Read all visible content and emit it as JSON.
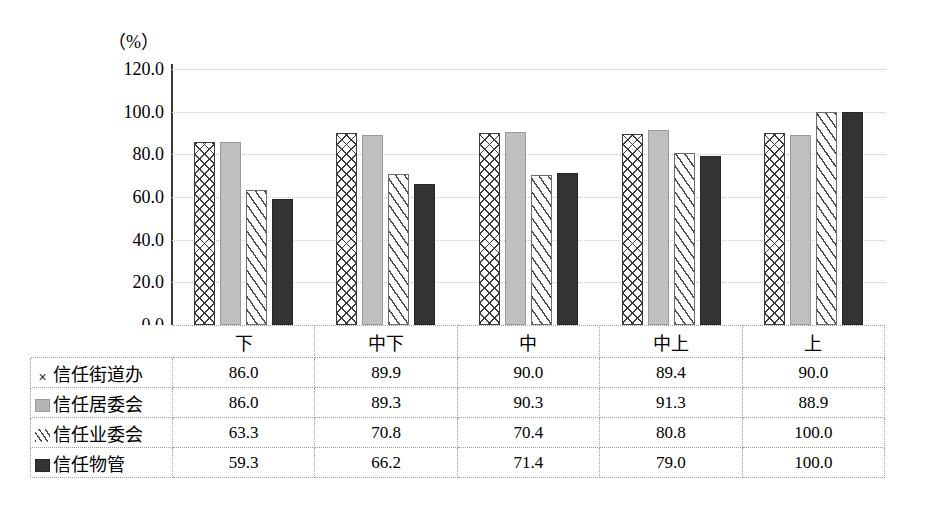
{
  "chart_data": {
    "type": "bar",
    "title": "",
    "subtitle": "",
    "xlabel": "",
    "ylabel": "(%)",
    "unit_label": "（%）",
    "ylim": [
      0.0,
      120.0
    ],
    "ytick_step": 20.0,
    "ytick_labels": [
      "120.0",
      "100.0",
      "80.0",
      "60.0",
      "40.0",
      "20.0",
      "0.0"
    ],
    "ytick_values": [
      120.0,
      100.0,
      80.0,
      60.0,
      40.0,
      20.0,
      0.0
    ],
    "grid": true,
    "grid_axis": "y",
    "legend_position": "table",
    "categories": [
      "下",
      "中下",
      "中",
      "中上",
      "上"
    ],
    "series": [
      {
        "name": "信任街道办",
        "marker": "cross-hatch-pattern",
        "marker_glyph": "×",
        "color": "#ffffff",
        "pattern": "crosshatch",
        "values": [
          86.0,
          89.9,
          90.0,
          89.4,
          90.0
        ],
        "value_labels": [
          "86.0",
          "89.9",
          "90.0",
          "89.4",
          "90.0"
        ]
      },
      {
        "name": "信任居委会",
        "marker": "light-gray-square",
        "marker_glyph": "",
        "color": "#bfbfbf",
        "pattern": "solid",
        "values": [
          86.0,
          89.3,
          90.3,
          91.3,
          88.9
        ],
        "value_labels": [
          "86.0",
          "89.3",
          "90.3",
          "91.3",
          "88.9"
        ]
      },
      {
        "name": "信任业委会",
        "marker": "diagonal-stripe-pattern",
        "marker_glyph": "",
        "color": "#ffffff",
        "pattern": "diagonal-stripes",
        "values": [
          63.3,
          70.8,
          70.4,
          80.8,
          100.0
        ],
        "value_labels": [
          "63.3",
          "70.8",
          "70.4",
          "80.8",
          "100.0"
        ]
      },
      {
        "name": "信任物管",
        "marker": "dark-square",
        "marker_glyph": "",
        "color": "#333333",
        "pattern": "solid",
        "values": [
          59.3,
          66.2,
          71.4,
          79.0,
          100.0
        ],
        "value_labels": [
          "59.3",
          "66.2",
          "71.4",
          "79.0",
          "100.0"
        ]
      }
    ]
  },
  "table": {
    "corner_label": "",
    "column_headers": [
      "下",
      "中下",
      "中",
      "中上",
      "上"
    ],
    "rows": [
      {
        "label": "信任街道办",
        "marker": "cross-icon",
        "values": [
          "86.0",
          "89.9",
          "90.0",
          "89.4",
          "90.0"
        ]
      },
      {
        "label": "信任居委会",
        "marker": "gray-square-icon",
        "values": [
          "86.0",
          "89.3",
          "90.3",
          "91.3",
          "88.9"
        ]
      },
      {
        "label": "信任业委会",
        "marker": "hatch-square-icon",
        "values": [
          "63.3",
          "70.8",
          "70.4",
          "80.8",
          "100.0"
        ]
      },
      {
        "label": "信任物管",
        "marker": "dark-square-icon",
        "values": [
          "59.3",
          "66.2",
          "71.4",
          "79.0",
          "100.0"
        ]
      }
    ]
  },
  "colors": {
    "series1": "#ffffff",
    "series2": "#bfbfbf",
    "series3": "#ffffff",
    "series4": "#333333",
    "axis": "#3a3a3a",
    "gridline": "#c8c8c8",
    "table_border": "#9e9e9e",
    "background": "#ffffff"
  }
}
